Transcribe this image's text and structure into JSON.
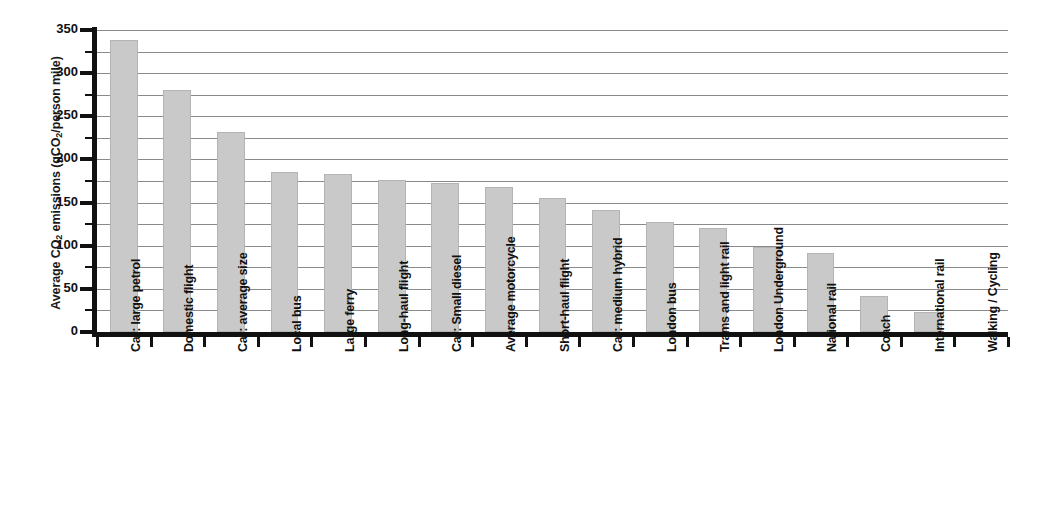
{
  "chart_data": {
    "type": "bar",
    "title": "",
    "xlabel": "",
    "ylabel": "Average CO2 emissions (gCO2/person mile)",
    "ylabel_parts": {
      "pre": "Average CO",
      "sub1": "2",
      "mid": " emissions (gCO",
      "sub2": "2",
      "post": "/person mile)"
    },
    "ylim": [
      0,
      350
    ],
    "ytick_step": 50,
    "yticks": [
      0,
      50,
      100,
      150,
      200,
      250,
      300,
      350
    ],
    "yminor_step": 25,
    "gridlines": [
      25,
      50,
      75,
      100,
      125,
      150,
      175,
      200,
      225,
      250,
      275,
      300,
      325,
      350
    ],
    "grid": true,
    "legend": "none",
    "bar_color": "#c9c9c9",
    "bar_edge_color": "#b4b4b4",
    "axis_color": "#111111",
    "grid_color": "#8a8a8a",
    "categories": [
      "Car: large petrol",
      "Domestic flight",
      "Car: average size",
      "Local bus",
      "Large ferry",
      "Long-haul flight",
      "Car: Small diesel",
      "Average motorcycle",
      "Short-haul flight",
      "Car: medium hybrid",
      "London bus",
      "Trams and light rail",
      "London Underground",
      "National rail",
      "Coach",
      "International rail",
      "Walking / Cycling"
    ],
    "values": [
      339,
      280,
      232,
      185,
      183,
      176,
      173,
      168,
      155,
      141,
      127,
      121,
      99,
      92,
      42,
      23,
      0
    ]
  }
}
